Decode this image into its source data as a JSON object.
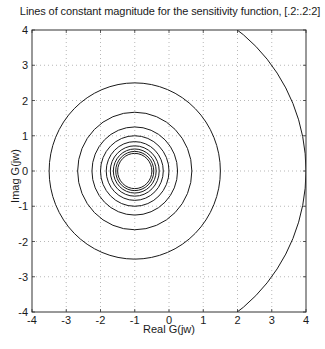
{
  "chart_data": {
    "type": "line",
    "title": "Lines of constant magnitude for the sensitivity function, [.2:.2:2]",
    "xlabel": "Real  G(jw)",
    "ylabel": "Imag  G(jw)",
    "xlim": [
      -4,
      4
    ],
    "ylim": [
      -4,
      4
    ],
    "xticks": [
      -4,
      -3,
      -2,
      -1,
      0,
      1,
      2,
      3,
      4
    ],
    "yticks": [
      -4,
      -3,
      -2,
      -1,
      0,
      1,
      2,
      3,
      4
    ],
    "grid": true,
    "grid_style": "dotted",
    "legend": null,
    "center": [
      -1,
      0
    ],
    "magnitudes": [
      0.2,
      0.4,
      0.6,
      0.8,
      1.0,
      1.2,
      1.4,
      1.6,
      1.8,
      2.0
    ],
    "radii": [
      5.0,
      2.5,
      1.667,
      1.25,
      1.0,
      0.833,
      0.714,
      0.625,
      0.556,
      0.5
    ],
    "line_color": "#1a1a1a"
  },
  "labels": {
    "title": "Lines of constant magnitude for the sensitivity function, [.2:.2:2]",
    "xlabel": "Real  G(jw)",
    "ylabel": "Imag  G(jw)"
  }
}
